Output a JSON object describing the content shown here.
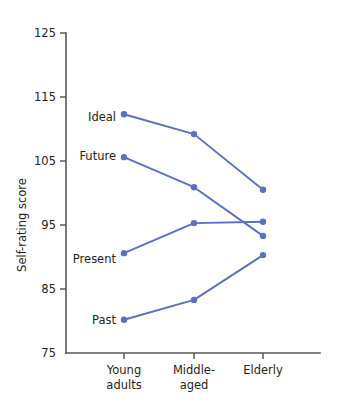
{
  "chart_data": {
    "type": "line",
    "title": "",
    "xlabel": "",
    "ylabel": "Self-rating score",
    "categories": [
      "Young\nadults",
      "Middle-\naged",
      "Elderly"
    ],
    "category_lines": [
      [
        "Young",
        "adults"
      ],
      [
        "Middle-",
        "aged"
      ],
      [
        "Elderly"
      ]
    ],
    "ylim": [
      75,
      125
    ],
    "yticks": [
      75,
      85,
      95,
      105,
      115,
      125
    ],
    "ytick_labels": [
      "75",
      "85",
      "95",
      "105",
      "115",
      "125"
    ],
    "grid": false,
    "legend": "inline-left-labels",
    "series": [
      {
        "name": "Ideal",
        "values": [
          112.3,
          109.2,
          100.5
        ]
      },
      {
        "name": "Future",
        "values": [
          105.6,
          100.9,
          93.3
        ]
      },
      {
        "name": "Present",
        "values": [
          90.6,
          95.3,
          95.5
        ]
      },
      {
        "name": "Past",
        "values": [
          80.2,
          83.3,
          90.3
        ]
      }
    ],
    "series_color": "#5b6fc4",
    "axis_color": "#58595b",
    "marker": "circle",
    "marker_radius": 3.2
  },
  "labels": {
    "ideal": "Ideal",
    "future": "Future",
    "present": "Present",
    "past": "Past",
    "y_axis_title": "Self-rating score",
    "y_125": "125",
    "y_115": "115",
    "y_105": "105",
    "y_95": "95",
    "y_85": "85",
    "y_75": "75",
    "x1_line1": "Young",
    "x1_line2": "adults",
    "x2_line1": "Middle-",
    "x2_line2": "aged",
    "x3_line1": "Elderly"
  }
}
